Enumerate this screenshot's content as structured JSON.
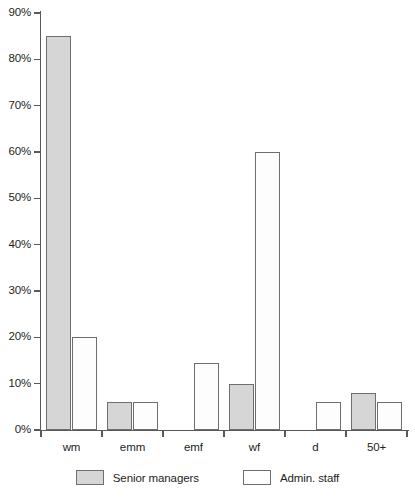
{
  "chart_data": {
    "type": "bar",
    "title": "",
    "subtitle": "",
    "xlabel": "",
    "ylabel": "",
    "ylim": [
      0,
      90
    ],
    "grid": false,
    "legend_position": "bottom-center",
    "categories": [
      "wm",
      "emm",
      "emf",
      "wf",
      "d",
      "50+"
    ],
    "ytick_labels": [
      "0%",
      "10%",
      "20%",
      "30%",
      "40%",
      "50%",
      "60%",
      "70%",
      "80%",
      "90%"
    ],
    "ytick_values": [
      0,
      10,
      20,
      30,
      40,
      50,
      60,
      70,
      80,
      90
    ],
    "series": [
      {
        "name": "Senior managers",
        "color": "#d6d6d6",
        "values": [
          85,
          6,
          null,
          10,
          null,
          8
        ]
      },
      {
        "name": "Admin. staff",
        "color": "#ffffff",
        "values": [
          20,
          6,
          14.5,
          60,
          6,
          6
        ]
      }
    ]
  },
  "legend": {
    "items": [
      {
        "label": "Senior managers",
        "swatch": "senior"
      },
      {
        "label": "Admin. staff",
        "swatch": "admin"
      }
    ]
  }
}
